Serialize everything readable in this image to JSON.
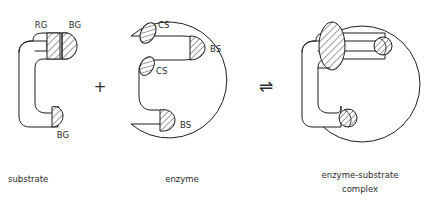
{
  "figure": {
    "type": "diagram",
    "background_color": "#ffffff",
    "line_color": "#1d1d1d",
    "text_color": "#2b2b2b"
  },
  "panels": {
    "substrate": {
      "caption": "substrate",
      "labels": {
        "reactive_group": "RG",
        "binding_group_top": "BG",
        "binding_group_bottom": "BG"
      }
    },
    "enzyme": {
      "caption": "enzyme",
      "labels": {
        "catalytic_site_top": "CS",
        "catalytic_site_mid": "CS",
        "binding_site_top": "BS",
        "binding_site_bottom": "BS"
      }
    },
    "complex": {
      "caption_line1": "enzyme-substrate",
      "caption_line2": "complex"
    }
  },
  "operators": {
    "plus": "+",
    "equilibrium": "⇌"
  }
}
